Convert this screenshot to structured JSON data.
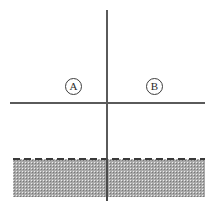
{
  "figure": {
    "title": "",
    "background_color": "#ffffff",
    "width": 213,
    "height": 210
  },
  "axes": {
    "vertical": {
      "name": "vertical-axis",
      "color": "#5a5a5a",
      "x": 107,
      "y_start": 10,
      "y_end": 201
    },
    "horizontal": {
      "name": "horizontal-axis",
      "color": "#5a5a5a",
      "y": 103,
      "x_start": 10,
      "x_end": 205
    },
    "origin": {
      "x": 107,
      "y": 103
    }
  },
  "labels": {
    "region_a": "A",
    "region_b": "B"
  },
  "shaded_region": {
    "name": "hatched-ground-region",
    "fill_color": "#a9a9a9",
    "border_style": "dashed",
    "border_color": "#3a3a3a",
    "x": 13,
    "y": 159,
    "width": 192,
    "height": 38
  }
}
